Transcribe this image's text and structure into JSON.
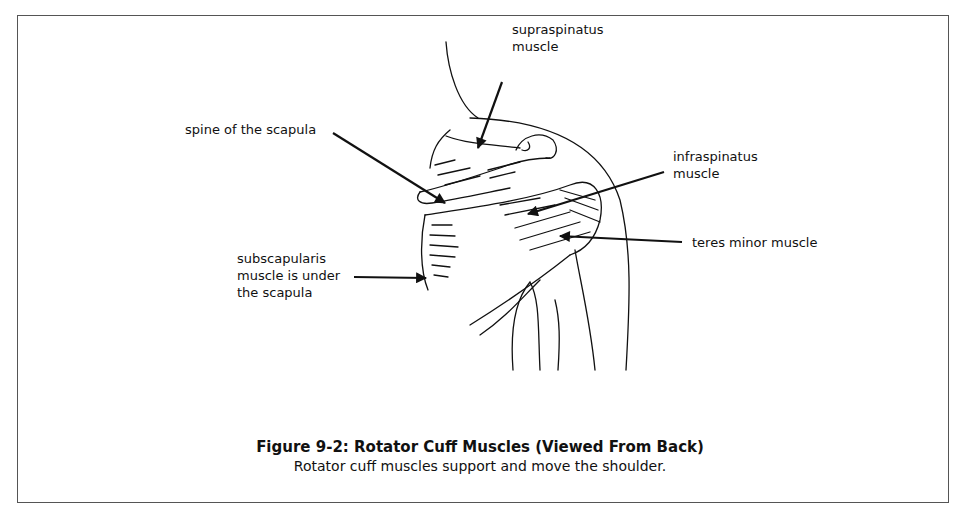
{
  "figure": {
    "title": "Figure 9-2: Rotator Cuff Muscles (Viewed From Back)",
    "caption": "Rotator cuff muscles support and move the shoulder."
  },
  "labels": {
    "supraspinatus_line1": "supraspinatus",
    "supraspinatus_line2": "muscle",
    "spine": "spine of the scapula",
    "infraspinatus_line1": "infraspinatus",
    "infraspinatus_line2": "muscle",
    "teres_minor": "teres minor muscle",
    "subscapularis_line1": "subscapularis",
    "subscapularis_line2": "muscle is under",
    "subscapularis_line3": "the scapula"
  },
  "colors": {
    "ink": "#111111",
    "frame": "#555555",
    "background": "#ffffff"
  }
}
